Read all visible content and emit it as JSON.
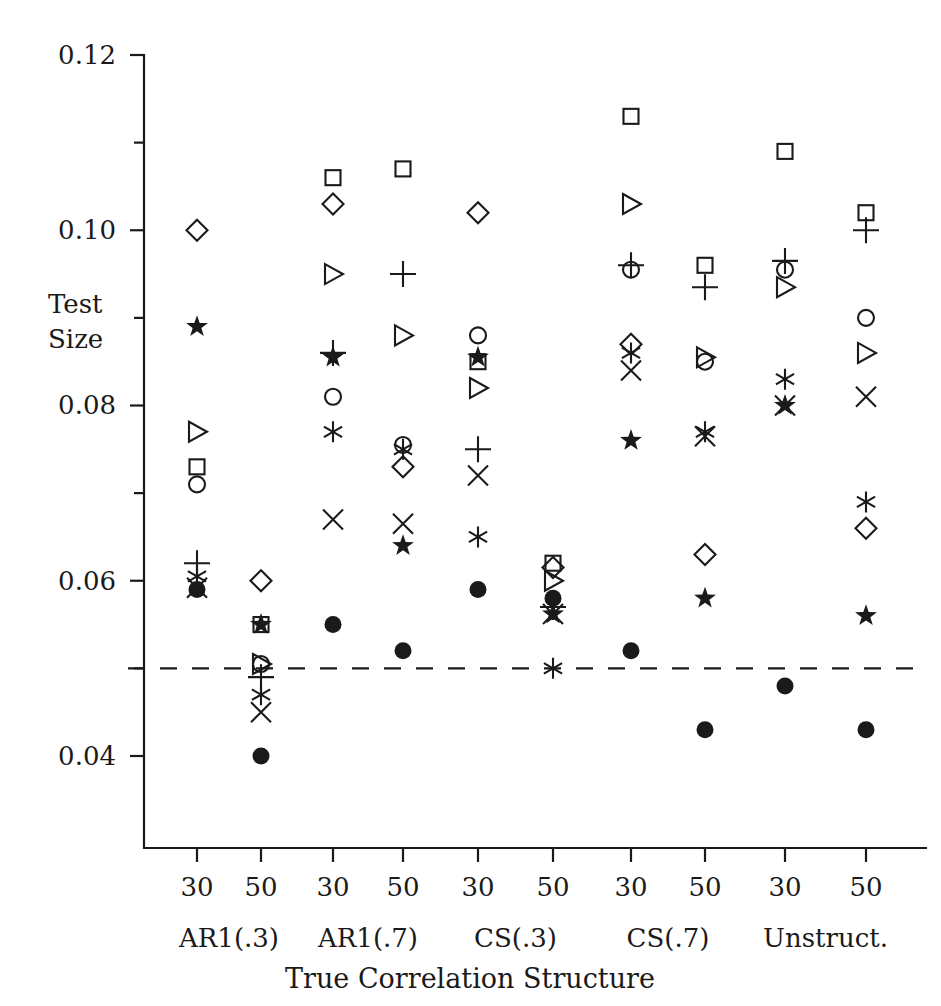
{
  "chart_data": {
    "type": "scatter",
    "title": "",
    "xlabel": "True Correlation Structure",
    "ylabel": "Test Size",
    "ylabel_lines": [
      "Test",
      "Size"
    ],
    "ylim": [
      0.0295,
      0.12
    ],
    "yticks": [
      0.12,
      0.1,
      0.08,
      0.06,
      0.04
    ],
    "ytick_labels": [
      "0.12",
      "0.10",
      "0.08",
      "0.06",
      "0.04"
    ],
    "yminor_ticks": [
      0.11,
      0.09,
      0.07,
      0.05
    ],
    "grid": false,
    "legend": "none",
    "reference_line": {
      "y": 0.05,
      "style": "dashed"
    },
    "x_categories": [
      "30",
      "50",
      "30",
      "50",
      "30",
      "50",
      "30",
      "50",
      "30",
      "50"
    ],
    "group_labels": [
      "AR1(.3)",
      "AR1(.7)",
      "CS(.3)",
      "CS(.7)",
      "Unstruct."
    ],
    "series": [
      {
        "name": "square",
        "marker": "square",
        "values": [
          0.073,
          0.055,
          0.106,
          0.107,
          0.085,
          0.062,
          0.113,
          0.096,
          0.109,
          0.102
        ]
      },
      {
        "name": "circle",
        "marker": "circle",
        "values": [
          0.071,
          0.0505,
          0.081,
          0.0755,
          0.088,
          null,
          0.0955,
          0.085,
          0.0955,
          0.09
        ]
      },
      {
        "name": "triangle",
        "marker": "triangle-right",
        "values": [
          0.077,
          0.0505,
          0.095,
          0.088,
          0.082,
          0.06,
          0.103,
          0.0855,
          0.0935,
          0.086
        ]
      },
      {
        "name": "diamond",
        "marker": "diamond",
        "values": [
          0.1,
          0.06,
          0.103,
          0.073,
          0.102,
          0.0615,
          0.087,
          0.063,
          null,
          0.066
        ]
      },
      {
        "name": "plus",
        "marker": "plus",
        "values": [
          0.062,
          0.049,
          0.086,
          0.095,
          0.075,
          0.057,
          0.096,
          0.0935,
          0.0965,
          0.1
        ]
      },
      {
        "name": "cross",
        "marker": "cross",
        "values": [
          0.0592,
          0.045,
          0.067,
          0.0665,
          0.072,
          0.0562,
          0.084,
          0.0765,
          0.08,
          0.081
        ]
      },
      {
        "name": "asterisk",
        "marker": "asterisk",
        "values": [
          0.0605,
          0.047,
          0.077,
          0.075,
          0.065,
          0.05,
          0.086,
          0.077,
          0.083,
          0.069
        ]
      },
      {
        "name": "star",
        "marker": "star",
        "values": [
          0.089,
          0.055,
          0.0855,
          0.064,
          0.0855,
          0.0562,
          0.076,
          0.058,
          0.08,
          0.056
        ]
      },
      {
        "name": "filled-circle",
        "marker": "filled-circle",
        "values": [
          0.059,
          0.04,
          0.055,
          0.052,
          0.059,
          0.058,
          0.052,
          0.043,
          0.048,
          0.043
        ]
      }
    ]
  },
  "axes": {
    "y_title_lines": [
      "Test",
      "Size"
    ],
    "x_title": "True Correlation Structure"
  }
}
